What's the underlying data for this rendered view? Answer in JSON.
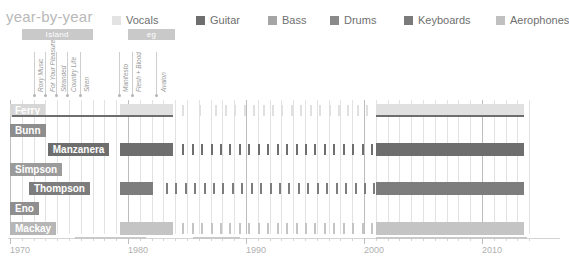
{
  "header": {
    "title": "year-by-year"
  },
  "legend": {
    "items": [
      {
        "label": "Vocals",
        "color": "#e3e3e3",
        "x": 0
      },
      {
        "label": "Guitar",
        "color": "#6e6e6e",
        "x": 84
      },
      {
        "label": "Bass",
        "color": "#a5a5a5",
        "x": 156
      },
      {
        "label": "Drums",
        "color": "#8a8a8a",
        "x": 218
      },
      {
        "label": "Keyboards",
        "color": "#7a7a7a",
        "x": 292
      },
      {
        "label": "Aerophones",
        "color": "#c0c0c0",
        "x": 384
      }
    ]
  },
  "eras": [
    {
      "label": "Island",
      "start": 1971,
      "end": 1977,
      "color": "#c9c9c9"
    },
    {
      "label": "eg",
      "start": 1980,
      "end": 1984,
      "color": "#c9c9c9"
    }
  ],
  "albums": [
    {
      "label": "Roxy Music",
      "year": 1972
    },
    {
      "label": "For Your Pleasure",
      "year": 1973
    },
    {
      "label": "Stranded",
      "year": 1973.9
    },
    {
      "label": "Country Life",
      "year": 1974.8
    },
    {
      "label": "Siren",
      "year": 1975.9
    },
    {
      "label": "Manifesto",
      "year": 1979.2
    },
    {
      "label": "Flesh + Blood",
      "year": 1980.3
    },
    {
      "label": "Avalon",
      "year": 1982.4
    }
  ],
  "rows": [
    {
      "name": "Ferry",
      "label": "Ferry",
      "instrument": "Vocals",
      "color": "#e0e0e0",
      "accent": "#6e6e6e",
      "label_bg": "#d6d6d6",
      "label_x": 1970,
      "blocks": [
        {
          "start": 1979.3,
          "end": 1983.8
        }
      ],
      "right": {
        "start": 2001,
        "end": 2013.6
      },
      "ticks": [
        1984.6,
        1986,
        1987.4,
        1988.2,
        1989,
        1989.8,
        1990.6,
        1991.4,
        1992.2,
        1993,
        1993.8,
        1994.6,
        1995.4,
        1996.2,
        1997,
        1997.8,
        1998.6,
        1999.4,
        2000.2
      ]
    },
    {
      "name": "Bunn",
      "label": "Bunn",
      "instrument": "Bass",
      "color": "#a5a5a5",
      "accent": "#a5a5a5",
      "label_bg": "#8d8d8d",
      "label_x": 1970,
      "blocks": [],
      "right": null,
      "ticks": []
    },
    {
      "name": "Manzanera",
      "label": "Manzanera",
      "instrument": "Guitar",
      "color": "#6e6e6e",
      "accent": "#6e6e6e",
      "label_bg": "#6e6e6e",
      "label_x": 1973.2,
      "blocks": [
        {
          "start": 1979.3,
          "end": 1983.8
        }
      ],
      "right": {
        "start": 2001,
        "end": 2013.6
      },
      "ticks": [
        1984.6,
        1985.4,
        1986.2,
        1987,
        1987.8,
        1988.6,
        1989.4,
        1990.2,
        1991,
        1991.8,
        1992.6,
        1993.4,
        1994.2,
        1995,
        1995.8,
        1996.6,
        1997.4,
        1998.2,
        1999,
        1999.8,
        2000.6
      ]
    },
    {
      "name": "Simpson",
      "label": "Simpson",
      "instrument": "Drums",
      "color": "#8a8a8a",
      "accent": "#8a8a8a",
      "label_bg": "#9b9b9b",
      "label_x": 1970,
      "blocks": [],
      "right": null,
      "ticks": []
    },
    {
      "name": "Thompson",
      "label": "Thompson",
      "instrument": "Drums",
      "color": "#7d7d7d",
      "accent": "#7d7d7d",
      "label_bg": "#7d7d7d",
      "label_x": 1971.6,
      "blocks": [
        {
          "start": 1979.3,
          "end": 1982.1
        }
      ],
      "right": {
        "start": 2001,
        "end": 2013.6
      },
      "ticks": [
        1983.2,
        1984,
        1984.8,
        1985.6,
        1986.4,
        1987.2,
        1988,
        1988.8,
        1989.6,
        1990.4,
        1991.2,
        1992,
        1992.8,
        1993.6,
        1994.4,
        1995.2,
        1996,
        1996.8,
        1997.6,
        1998.4,
        1999.2,
        2000,
        2000.8
      ]
    },
    {
      "name": "Eno",
      "label": "Eno",
      "instrument": "Keyboards",
      "color": "#8f8f8f",
      "accent": "#8f8f8f",
      "label_bg": "#8f8f8f",
      "label_x": 1970,
      "blocks": [],
      "right": null,
      "ticks": []
    },
    {
      "name": "Mackay",
      "label": "Mackay",
      "instrument": "Aerophones",
      "color": "#c4c4c4",
      "accent": "#c4c4c4",
      "label_bg": "#b6b6b6",
      "label_x": 1970,
      "blocks": [
        {
          "start": 1979.3,
          "end": 1983.8
        }
      ],
      "right": {
        "start": 2001,
        "end": 2013.6
      },
      "ticks": [
        1984.6,
        1985.4,
        1986.2,
        1987,
        1987.8,
        1988.6,
        1989.4,
        1990.2,
        1991,
        1991.8,
        1992.6,
        1993.4,
        1994.2,
        1995,
        1995.8,
        1996.6,
        1997.4,
        1998.2,
        1999,
        1999.8,
        2000.6
      ]
    }
  ],
  "chart_data": {
    "type": "bar",
    "title": "year-by-year",
    "xlabel": "",
    "ylabel": "",
    "xlim": [
      1970,
      2014
    ],
    "grid": true,
    "legend_position": "top",
    "categories": [
      "Ferry",
      "Bunn",
      "Manzanera",
      "Simpson",
      "Thompson",
      "Eno",
      "Mackay"
    ],
    "series": [
      {
        "name": "Vocals",
        "color": "#e3e3e3",
        "member": "Ferry"
      },
      {
        "name": "Guitar",
        "color": "#6e6e6e",
        "member": "Manzanera"
      },
      {
        "name": "Bass",
        "color": "#a5a5a5",
        "member": "Bunn"
      },
      {
        "name": "Drums",
        "color": "#8a8a8a",
        "member": "Simpson"
      },
      {
        "name": "Keyboards",
        "color": "#7a7a7a",
        "member": "Eno"
      },
      {
        "name": "Aerophones",
        "color": "#c0c0c0",
        "member": "Mackay"
      }
    ],
    "x_ticks": [
      1970,
      1980,
      1990,
      2000,
      2010
    ],
    "x_tick_labels": [
      "1970",
      "1980",
      "1990",
      "2000",
      "2010"
    ],
    "eras": [
      {
        "label": "Island",
        "start": 1971,
        "end": 1977
      },
      {
        "label": "eg",
        "start": 1980,
        "end": 1984
      }
    ],
    "albums": [
      {
        "label": "Roxy Music",
        "year": 1972
      },
      {
        "label": "For Your Pleasure",
        "year": 1973
      },
      {
        "label": "Stranded",
        "year": 1974
      },
      {
        "label": "Country Life",
        "year": 1975
      },
      {
        "label": "Siren",
        "year": 1976
      },
      {
        "label": "Manifesto",
        "year": 1979
      },
      {
        "label": "Flesh + Blood",
        "year": 1980
      },
      {
        "label": "Avalon",
        "year": 1982
      }
    ]
  },
  "axis": {
    "labels": [
      "1970",
      "1980",
      "1990",
      "2000",
      "2010"
    ],
    "years": [
      1970,
      1980,
      1990,
      2000,
      2010
    ]
  }
}
